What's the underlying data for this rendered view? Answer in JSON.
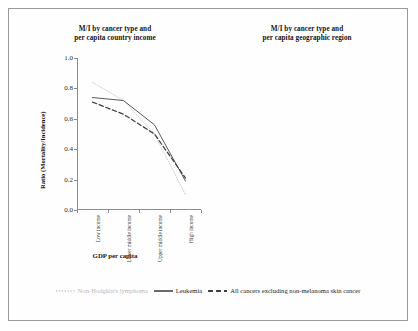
{
  "figure": {
    "legend": [
      {
        "label": "Non-Hodgkin's lymphoma",
        "style": "dotted",
        "color": "#c9c9c9"
      },
      {
        "label": "Leukemia",
        "style": "solid",
        "color": "#555555"
      },
      {
        "label": "All cancers excluding non-melanoma skin cancer",
        "style": "dashed",
        "color": "#444444"
      }
    ]
  },
  "chart_data": [
    {
      "type": "line",
      "panel": "left",
      "title": "M/I by cancer type and\nper capita country income",
      "title_line1": "M/I by cancer type and",
      "title_line2": "per capita country income",
      "xlabel": "GDP per capita",
      "ylabel": "Ratio (Mortality/Incidence)",
      "categories": [
        "Low income",
        "Lower middle income",
        "Upper middle income",
        "High income"
      ],
      "ylim": [
        0.0,
        1.0
      ],
      "yticks": [
        "0.0",
        "0.2",
        "0.4",
        "0.6",
        "0.8",
        "1.0"
      ],
      "grid": false,
      "legend_position": "bottom",
      "series": [
        {
          "name": "Non-Hodgkin's lymphoma",
          "style": "dotted",
          "values": [
            0.84,
            0.72,
            0.5,
            0.1
          ]
        },
        {
          "name": "Leukemia",
          "style": "solid",
          "values": [
            0.74,
            0.72,
            0.56,
            0.19
          ]
        },
        {
          "name": "All cancers excluding non-melanoma skin cancer",
          "style": "dashed",
          "values": [
            0.71,
            0.63,
            0.5,
            0.21
          ]
        }
      ]
    },
    {
      "type": "line",
      "panel": "right",
      "title": "M/I by cancer type and\nper capita geographic region",
      "title_line1": "M/I by cancer type and",
      "title_line2": "per capita geographic region",
      "xlabel": "",
      "ylabel": "Ratio (Mortality/Incidence)",
      "categories": [
        "Sub-Saharan Africa",
        "South Asia",
        "Asia",
        "Middle East & North Africa",
        "Latin America & Caribbean",
        "Europe East & Central",
        "East Asia & Pacific",
        "Oceania",
        "Europe",
        "North America"
      ],
      "ylim": [
        0.0,
        1.0
      ],
      "yticks": [
        "0.0",
        "0.2",
        "0.4",
        "0.6",
        "0.8",
        "1.0"
      ],
      "grid": false,
      "legend_position": "bottom",
      "series": [
        {
          "name": "Non-Hodgkin's lymphoma",
          "style": "dotted",
          "values": [
            0.8,
            0.52,
            0.66,
            0.79,
            0.5,
            0.36,
            0.53,
            0.47,
            0.07,
            0.07
          ]
        },
        {
          "name": "Leukemia",
          "style": "solid",
          "values": [
            1.0,
            0.58,
            0.73,
            0.91,
            0.53,
            0.52,
            0.72,
            0.45,
            0.15,
            0.13
          ]
        },
        {
          "name": "All cancers excluding non-melanoma skin cancer",
          "style": "dashed",
          "values": [
            0.79,
            0.51,
            0.6,
            0.71,
            0.5,
            0.47,
            0.57,
            0.44,
            0.15,
            0.16
          ]
        }
      ]
    }
  ]
}
